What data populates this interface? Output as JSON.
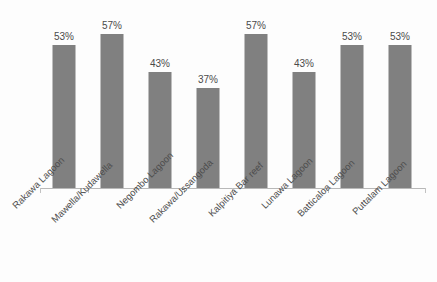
{
  "chart_data": {
    "type": "bar",
    "title": "",
    "subtitle": "",
    "xlabel": "",
    "ylabel": "",
    "categories": [
      "Rakawa Lagoon",
      "Mawella/Kudawella",
      "Negombo Lagoon",
      "Rakawa/Ussangoda",
      "Kalpitiya Bar reef",
      "Lunawa Lagoon",
      "Batticaloa Lagoon",
      "Puttalam Lagoon"
    ],
    "values": [
      53,
      57,
      43,
      37,
      57,
      43,
      53,
      53
    ],
    "data_labels": [
      "53%",
      "57%",
      "43%",
      "37%",
      "57%",
      "43%",
      "53%",
      "53%"
    ],
    "ylim": [
      0,
      70
    ],
    "grid": false,
    "legend": null,
    "legend_position": "none",
    "axis_tick_labels": [],
    "colors": {
      "bar": "#808080",
      "axis": "#b8b8b8",
      "tick": "#c2c2c2",
      "label_text": "#4d4d4d",
      "value_text": "#4a4a4a",
      "background": "#fdfdfd"
    }
  }
}
